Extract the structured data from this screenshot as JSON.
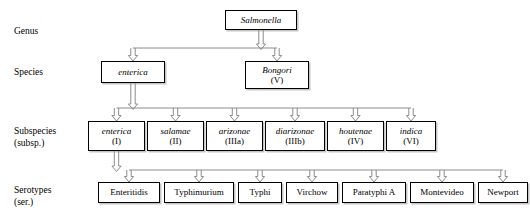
{
  "diagram": {
    "background": "#ffffff",
    "line_color": "#808080",
    "box_border_color": "#000000",
    "rows": [
      {
        "id": "genus",
        "label": "Genus"
      },
      {
        "id": "species",
        "label": "Species"
      },
      {
        "id": "subspecies",
        "label": "Subspecies\n(subsp.)"
      },
      {
        "id": "serotypes",
        "label": "Serotypes\n(ser.)"
      }
    ],
    "genus": [
      {
        "name": "Salmonella",
        "sub": "",
        "italic": true,
        "x": 225,
        "y": 10,
        "w": 72,
        "h": 20
      }
    ],
    "species": [
      {
        "name": "enterica",
        "sub": "",
        "italic": true,
        "x": 101,
        "y": 61,
        "w": 64,
        "h": 22
      },
      {
        "name": "Bongori",
        "sub": "(V)",
        "italic": true,
        "x": 245,
        "y": 61,
        "w": 64,
        "h": 28
      }
    ],
    "subspecies": [
      {
        "name": "enterica",
        "sub": "(I)",
        "italic": true,
        "x": 88,
        "y": 121,
        "w": 57,
        "h": 30
      },
      {
        "name": "salamae",
        "sub": "(II)",
        "italic": true,
        "x": 147,
        "y": 121,
        "w": 57,
        "h": 30
      },
      {
        "name": "arizonae",
        "sub": "(IIIa)",
        "italic": true,
        "x": 206,
        "y": 121,
        "w": 57,
        "h": 30
      },
      {
        "name": "diarizonae",
        "sub": "(IIIb)",
        "italic": true,
        "x": 265,
        "y": 121,
        "w": 60,
        "h": 30
      },
      {
        "name": "houtenae",
        "sub": "(IV)",
        "italic": true,
        "x": 327,
        "y": 121,
        "w": 57,
        "h": 30
      },
      {
        "name": "indica",
        "sub": "(VI)",
        "italic": true,
        "x": 386,
        "y": 121,
        "w": 50,
        "h": 30
      }
    ],
    "serotypes": [
      {
        "name": "Enteritidis",
        "sub": "",
        "italic": false,
        "x": 98,
        "y": 182,
        "w": 62,
        "h": 21
      },
      {
        "name": "Typhimurium",
        "sub": "",
        "italic": false,
        "x": 164,
        "y": 182,
        "w": 70,
        "h": 21
      },
      {
        "name": "Typhi",
        "sub": "",
        "italic": false,
        "x": 238,
        "y": 182,
        "w": 44,
        "h": 21
      },
      {
        "name": "Virchow",
        "sub": "",
        "italic": false,
        "x": 286,
        "y": 182,
        "w": 52,
        "h": 21
      },
      {
        "name": "Paratyphi A",
        "sub": "",
        "italic": false,
        "x": 342,
        "y": 182,
        "w": 64,
        "h": 21
      },
      {
        "name": "Montevideo",
        "sub": "",
        "italic": false,
        "x": 410,
        "y": 182,
        "w": 64,
        "h": 21
      },
      {
        "name": "Newport",
        "sub": "",
        "italic": false,
        "x": 478,
        "y": 182,
        "w": 50,
        "h": 21
      }
    ]
  }
}
